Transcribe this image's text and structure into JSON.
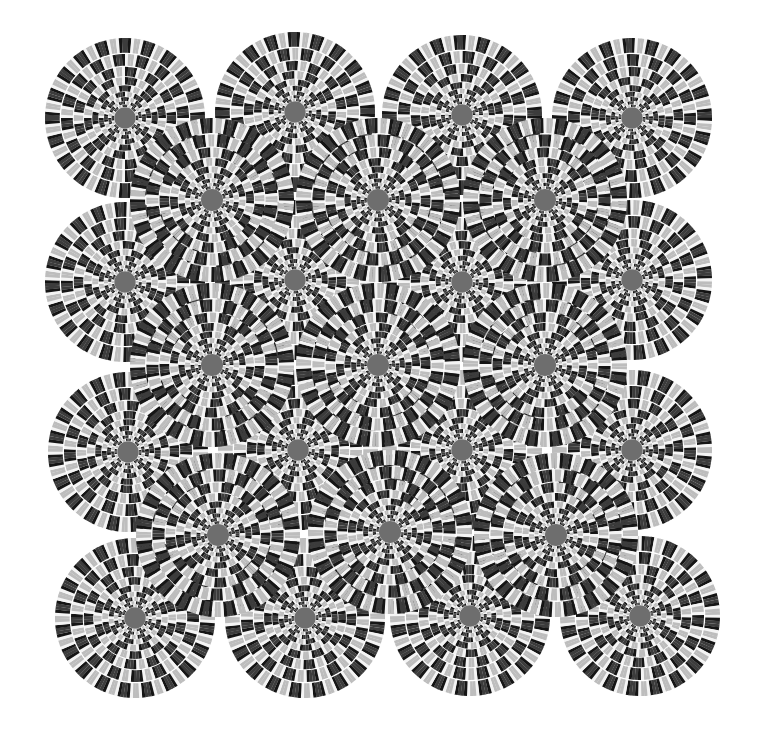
{
  "artwork": {
    "title": "Rotating snakes optical illusion",
    "width": 767,
    "height": 733,
    "background": "#ffffff",
    "palette": [
      "#3c3c3c",
      "#151515",
      "#f4f4f4",
      "#bdbdbd"
    ],
    "rings": 9,
    "segments_outer": 40,
    "large_circles": [
      {
        "cx": 125,
        "cy": 118,
        "r": 80
      },
      {
        "cx": 295,
        "cy": 112,
        "r": 80
      },
      {
        "cx": 462,
        "cy": 115,
        "r": 80
      },
      {
        "cx": 632,
        "cy": 118,
        "r": 80
      },
      {
        "cx": 125,
        "cy": 282,
        "r": 80
      },
      {
        "cx": 295,
        "cy": 280,
        "r": 80
      },
      {
        "cx": 462,
        "cy": 282,
        "r": 80
      },
      {
        "cx": 632,
        "cy": 280,
        "r": 80
      },
      {
        "cx": 128,
        "cy": 452,
        "r": 80
      },
      {
        "cx": 298,
        "cy": 450,
        "r": 80
      },
      {
        "cx": 462,
        "cy": 450,
        "r": 80
      },
      {
        "cx": 632,
        "cy": 450,
        "r": 80
      },
      {
        "cx": 135,
        "cy": 618,
        "r": 80
      },
      {
        "cx": 305,
        "cy": 618,
        "r": 80
      },
      {
        "cx": 470,
        "cy": 616,
        "r": 80
      },
      {
        "cx": 640,
        "cy": 616,
        "r": 80
      }
    ],
    "small_circles": [
      {
        "cx": 212,
        "cy": 200,
        "r": 82
      },
      {
        "cx": 378,
        "cy": 200,
        "r": 82
      },
      {
        "cx": 545,
        "cy": 200,
        "r": 82
      },
      {
        "cx": 212,
        "cy": 365,
        "r": 82
      },
      {
        "cx": 378,
        "cy": 365,
        "r": 82
      },
      {
        "cx": 545,
        "cy": 365,
        "r": 82
      },
      {
        "cx": 218,
        "cy": 535,
        "r": 82
      },
      {
        "cx": 390,
        "cy": 532,
        "r": 82
      },
      {
        "cx": 556,
        "cy": 535,
        "r": 82
      }
    ]
  }
}
